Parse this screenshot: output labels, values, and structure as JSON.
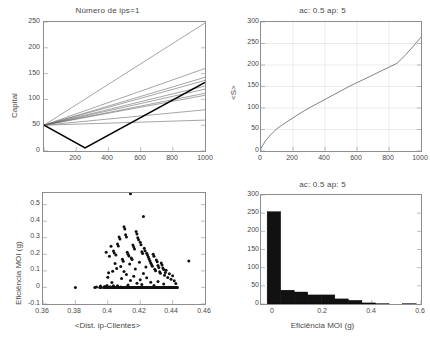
{
  "figure": {
    "width": 430,
    "height": 350,
    "background": "#ffffff",
    "axis_color": "#8e8e8e",
    "text_color": "#4a4a4a",
    "data_color": "#111111"
  },
  "chart_data": [
    {
      "id": "capital-vs-time",
      "type": "line",
      "title": "Número de ips=1",
      "xlabel": "",
      "ylabel": "Capital",
      "xlim": [
        0,
        1000
      ],
      "ylim": [
        0,
        250
      ],
      "xticks": [
        0,
        200,
        400,
        600,
        800,
        1000
      ],
      "xticklabels": [
        "",
        "200",
        "400",
        "600",
        "800",
        "1000"
      ],
      "yticks": [
        0,
        50,
        100,
        150,
        200,
        250
      ],
      "yticklabels": [
        "0",
        "50",
        "100",
        "150",
        "200",
        "250"
      ],
      "grid": false,
      "legend": "none",
      "series": [
        {
          "name": "ip-1",
          "emphasis": "normal",
          "x": [
            0,
            1000
          ],
          "y": [
            50,
            248
          ]
        },
        {
          "name": "ip-2",
          "emphasis": "normal",
          "x": [
            0,
            1000
          ],
          "y": [
            50,
            160
          ]
        },
        {
          "name": "ip-3",
          "emphasis": "normal",
          "x": [
            0,
            1000
          ],
          "y": [
            50,
            143
          ]
        },
        {
          "name": "ip-4",
          "emphasis": "normal",
          "x": [
            0,
            1000
          ],
          "y": [
            50,
            137
          ]
        },
        {
          "name": "ip-5",
          "emphasis": "normal",
          "x": [
            0,
            1000
          ],
          "y": [
            50,
            126
          ]
        },
        {
          "name": "ip-6",
          "emphasis": "normal",
          "x": [
            0,
            1000
          ],
          "y": [
            50,
            120
          ]
        },
        {
          "name": "ip-7",
          "emphasis": "normal",
          "x": [
            0,
            1000
          ],
          "y": [
            50,
            112
          ]
        },
        {
          "name": "ip-8",
          "emphasis": "normal",
          "x": [
            0,
            1000
          ],
          "y": [
            50,
            108
          ]
        },
        {
          "name": "ip-9",
          "emphasis": "normal",
          "x": [
            0,
            1000
          ],
          "y": [
            50,
            80
          ]
        },
        {
          "name": "ip-10",
          "emphasis": "normal",
          "x": [
            0,
            1000
          ],
          "y": [
            50,
            60
          ]
        },
        {
          "name": "media",
          "emphasis": "bold",
          "x": [
            0,
            255,
            1000
          ],
          "y": [
            50,
            6,
            133
          ]
        }
      ]
    },
    {
      "id": "mean-S-vs-time",
      "type": "line",
      "title": "ac: 0.5   ap: 5",
      "xlabel": "",
      "ylabel": "<S>",
      "xlim": [
        0,
        1000
      ],
      "ylim": [
        0,
        300
      ],
      "xticks": [
        0,
        200,
        400,
        600,
        800,
        1000
      ],
      "xticklabels": [
        "0",
        "200",
        "400",
        "600",
        "800",
        "1000"
      ],
      "yticks": [
        0,
        50,
        100,
        150,
        200,
        250,
        300
      ],
      "yticklabels": [
        "0",
        "50",
        "100",
        "150",
        "200",
        "250",
        "300"
      ],
      "grid": true,
      "legend": "none",
      "series": [
        {
          "name": "<S>",
          "emphasis": "normal",
          "x": [
            0,
            25,
            50,
            75,
            100,
            150,
            200,
            250,
            300,
            350,
            400,
            450,
            500,
            550,
            600,
            650,
            700,
            750,
            800,
            850,
            900,
            950,
            1000
          ],
          "y": [
            6,
            22,
            34,
            43,
            52,
            65,
            77,
            89,
            100,
            110,
            120,
            130,
            140,
            150,
            159,
            168,
            177,
            186,
            195,
            204,
            222,
            243,
            265
          ]
        }
      ]
    },
    {
      "id": "efficiency-vs-distance",
      "type": "scatter",
      "title": "",
      "xlabel": "<Dist. ip-Clientes>",
      "ylabel": "Eficiência MOI (g)",
      "xlim": [
        0.36,
        0.46
      ],
      "ylim": [
        -0.1,
        0.57
      ],
      "xticks": [
        0.36,
        0.38,
        0.4,
        0.42,
        0.44,
        0.46
      ],
      "xticklabels": [
        "0.36",
        "0.38",
        "0.4",
        "0.42",
        "0.44",
        "0.46"
      ],
      "yticks": [
        -0.1,
        0,
        0.1,
        0.2,
        0.3,
        0.4,
        0.5
      ],
      "yticklabels": [
        "-0.1",
        "0",
        "0.1",
        "0.2",
        "0.3",
        "0.4",
        "0.5"
      ],
      "grid": false,
      "legend": "none",
      "marker": "dot",
      "points": [
        [
          0.38,
          0.0
        ],
        [
          0.392,
          0.0
        ],
        [
          0.393,
          0.003
        ],
        [
          0.395,
          0.0
        ],
        [
          0.3955,
          0.008
        ],
        [
          0.396,
          0.0
        ],
        [
          0.3975,
          0.0
        ],
        [
          0.398,
          0.005
        ],
        [
          0.3985,
          0.0
        ],
        [
          0.399,
          0.0
        ],
        [
          0.3995,
          0.012
        ],
        [
          0.4,
          0.0
        ],
        [
          0.4005,
          0.0
        ],
        [
          0.401,
          0.0
        ],
        [
          0.4015,
          0.004
        ],
        [
          0.402,
          0.0
        ],
        [
          0.4025,
          0.0
        ],
        [
          0.403,
          0.0
        ],
        [
          0.4035,
          0.01
        ],
        [
          0.404,
          0.0
        ],
        [
          0.4045,
          0.0
        ],
        [
          0.405,
          0.0
        ],
        [
          0.4055,
          0.0
        ],
        [
          0.406,
          0.006
        ],
        [
          0.4065,
          0.0
        ],
        [
          0.407,
          0.0
        ],
        [
          0.4075,
          0.0
        ],
        [
          0.408,
          0.002
        ],
        [
          0.4085,
          0.0
        ],
        [
          0.409,
          0.0
        ],
        [
          0.4095,
          0.0
        ],
        [
          0.41,
          0.0
        ],
        [
          0.4105,
          0.0
        ],
        [
          0.411,
          0.0
        ],
        [
          0.4115,
          0.003
        ],
        [
          0.412,
          0.0
        ],
        [
          0.4125,
          0.0
        ],
        [
          0.413,
          0.0
        ],
        [
          0.4135,
          0.0
        ],
        [
          0.414,
          0.0
        ],
        [
          0.4145,
          0.0
        ],
        [
          0.415,
          0.0
        ],
        [
          0.4155,
          0.0
        ],
        [
          0.416,
          0.0
        ],
        [
          0.4165,
          0.0
        ],
        [
          0.417,
          0.0
        ],
        [
          0.4175,
          0.0
        ],
        [
          0.418,
          0.0
        ],
        [
          0.4185,
          0.0
        ],
        [
          0.419,
          0.0
        ],
        [
          0.4195,
          0.0
        ],
        [
          0.42,
          0.0
        ],
        [
          0.4205,
          0.0
        ],
        [
          0.421,
          0.0
        ],
        [
          0.4215,
          0.0
        ],
        [
          0.422,
          0.0
        ],
        [
          0.4225,
          0.0
        ],
        [
          0.423,
          0.0
        ],
        [
          0.4235,
          0.0
        ],
        [
          0.424,
          0.0
        ],
        [
          0.4245,
          0.0
        ],
        [
          0.425,
          0.0
        ],
        [
          0.4255,
          0.0
        ],
        [
          0.426,
          0.0
        ],
        [
          0.4265,
          0.0
        ],
        [
          0.427,
          0.0
        ],
        [
          0.4275,
          0.0
        ],
        [
          0.428,
          0.0
        ],
        [
          0.4285,
          0.0
        ],
        [
          0.429,
          0.0
        ],
        [
          0.4295,
          0.0
        ],
        [
          0.43,
          0.0
        ],
        [
          0.4305,
          0.0
        ],
        [
          0.431,
          0.0
        ],
        [
          0.4315,
          0.0
        ],
        [
          0.432,
          0.0
        ],
        [
          0.4325,
          0.0
        ],
        [
          0.433,
          0.0
        ],
        [
          0.4335,
          0.0
        ],
        [
          0.434,
          0.0
        ],
        [
          0.4345,
          0.0
        ],
        [
          0.435,
          0.0
        ],
        [
          0.4355,
          0.0
        ],
        [
          0.436,
          0.0
        ],
        [
          0.4365,
          0.0
        ],
        [
          0.437,
          0.0
        ],
        [
          0.4375,
          0.0
        ],
        [
          0.438,
          0.0
        ],
        [
          0.4385,
          0.0
        ],
        [
          0.439,
          0.0
        ],
        [
          0.4395,
          0.0
        ],
        [
          0.44,
          0.0
        ],
        [
          0.4405,
          0.0
        ],
        [
          0.441,
          0.0
        ],
        [
          0.4415,
          0.0
        ],
        [
          0.442,
          0.0
        ],
        [
          0.4425,
          0.0
        ],
        [
          0.443,
          0.0
        ],
        [
          0.414,
          0.565
        ],
        [
          0.422,
          0.428
        ],
        [
          0.41,
          0.367
        ],
        [
          0.4105,
          0.352
        ],
        [
          0.4175,
          0.338
        ],
        [
          0.418,
          0.322
        ],
        [
          0.411,
          0.318
        ],
        [
          0.4115,
          0.305
        ],
        [
          0.4185,
          0.3
        ],
        [
          0.419,
          0.288
        ],
        [
          0.407,
          0.305
        ],
        [
          0.4075,
          0.292
        ],
        [
          0.42,
          0.272
        ],
        [
          0.4205,
          0.258
        ],
        [
          0.406,
          0.262
        ],
        [
          0.4065,
          0.25
        ],
        [
          0.402,
          0.248
        ],
        [
          0.4155,
          0.256
        ],
        [
          0.416,
          0.244
        ],
        [
          0.4165,
          0.232
        ],
        [
          0.4225,
          0.236
        ],
        [
          0.423,
          0.222
        ],
        [
          0.4035,
          0.22
        ],
        [
          0.404,
          0.208
        ],
        [
          0.399,
          0.212
        ],
        [
          0.421,
          0.215
        ],
        [
          0.4215,
          0.205
        ],
        [
          0.424,
          0.206
        ],
        [
          0.4245,
          0.196
        ],
        [
          0.428,
          0.2
        ],
        [
          0.4285,
          0.188
        ],
        [
          0.412,
          0.212
        ],
        [
          0.4125,
          0.2
        ],
        [
          0.413,
          0.19
        ],
        [
          0.405,
          0.196
        ],
        [
          0.401,
          0.188
        ],
        [
          0.425,
          0.184
        ],
        [
          0.4255,
          0.172
        ],
        [
          0.4145,
          0.178
        ],
        [
          0.415,
          0.168
        ],
        [
          0.45,
          0.16
        ],
        [
          0.43,
          0.166
        ],
        [
          0.4305,
          0.155
        ],
        [
          0.409,
          0.17
        ],
        [
          0.4095,
          0.158
        ],
        [
          0.426,
          0.16
        ],
        [
          0.4265,
          0.148
        ],
        [
          0.4195,
          0.152
        ],
        [
          0.433,
          0.148
        ],
        [
          0.4335,
          0.136
        ],
        [
          0.4045,
          0.145
        ],
        [
          0.4135,
          0.142
        ],
        [
          0.427,
          0.138
        ],
        [
          0.4275,
          0.128
        ],
        [
          0.431,
          0.132
        ],
        [
          0.4315,
          0.12
        ],
        [
          0.408,
          0.126
        ],
        [
          0.4235,
          0.124
        ],
        [
          0.434,
          0.118
        ],
        [
          0.4345,
          0.108
        ],
        [
          0.4055,
          0.115
        ],
        [
          0.417,
          0.112
        ],
        [
          0.429,
          0.11
        ],
        [
          0.4295,
          0.1
        ],
        [
          0.436,
          0.104
        ],
        [
          0.403,
          0.098
        ],
        [
          0.41,
          0.096
        ],
        [
          0.432,
          0.095
        ],
        [
          0.4325,
          0.086
        ],
        [
          0.4355,
          0.09
        ],
        [
          0.4005,
          0.088
        ],
        [
          0.422,
          0.084
        ],
        [
          0.438,
          0.082
        ],
        [
          0.4115,
          0.078
        ],
        [
          0.435,
          0.074
        ],
        [
          0.44,
          0.07
        ],
        [
          0.416,
          0.068
        ],
        [
          0.4,
          0.062
        ],
        [
          0.437,
          0.06
        ],
        [
          0.424,
          0.058
        ],
        [
          0.4085,
          0.054
        ],
        [
          0.439,
          0.05
        ],
        [
          0.42,
          0.046
        ],
        [
          0.414,
          0.042
        ],
        [
          0.441,
          0.04
        ],
        [
          0.431,
          0.036
        ],
        [
          0.4265,
          0.032
        ],
        [
          0.4025,
          0.03
        ],
        [
          0.418,
          0.026
        ],
        [
          0.442,
          0.024
        ],
        [
          0.4345,
          0.02
        ],
        [
          0.421,
          0.018
        ],
        [
          0.4125,
          0.015
        ],
        [
          0.4285,
          0.012
        ],
        [
          0.406,
          0.01
        ]
      ]
    },
    {
      "id": "efficiency-histogram",
      "type": "bar",
      "title": "ac: 0.5   ap: 5",
      "xlabel": "Eficiência MOI (g)",
      "ylabel": "",
      "xlim": [
        -0.05,
        0.6
      ],
      "ylim": [
        0,
        300
      ],
      "xticks": [
        0,
        0.2,
        0.4,
        0.6
      ],
      "xticklabels": [
        "0",
        "0.2",
        "0.4",
        "0.6"
      ],
      "yticks": [
        0,
        50,
        100,
        150,
        200,
        250,
        300
      ],
      "yticklabels": [
        "0",
        "50",
        "100",
        "150",
        "200",
        "250",
        "300"
      ],
      "grid": false,
      "legend": "none",
      "bin_edges": [
        -0.025,
        0.03,
        0.085,
        0.14,
        0.195,
        0.25,
        0.305,
        0.36,
        0.415,
        0.47,
        0.525,
        0.58
      ],
      "categories": [
        "-0.025–0.03",
        "0.03–0.085",
        "0.085–0.14",
        "0.14–0.195",
        "0.195–0.25",
        "0.25–0.305",
        "0.305–0.36",
        "0.36–0.415",
        "0.415–0.47",
        "0.47–0.525",
        "0.525–0.58"
      ],
      "values": [
        254,
        38,
        33,
        25,
        25,
        14,
        10,
        3,
        1,
        0,
        1
      ]
    }
  ]
}
